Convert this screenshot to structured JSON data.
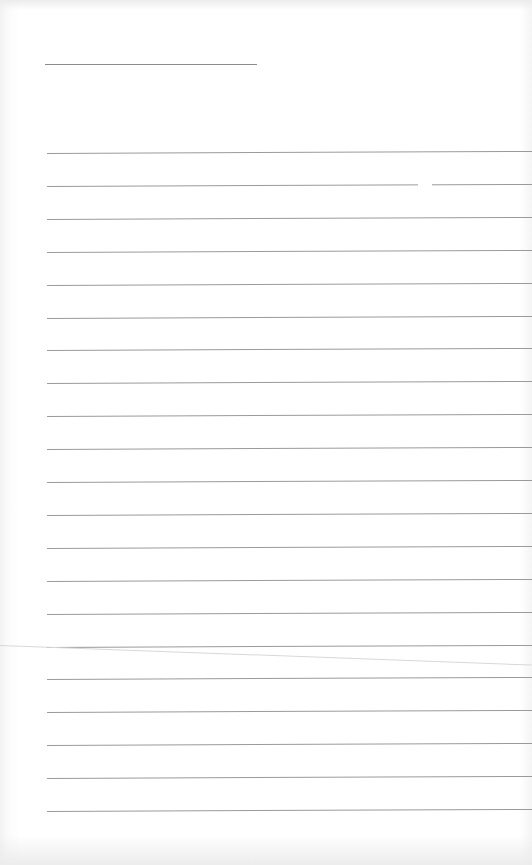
{
  "page": {
    "type": "blank ruled notebook page",
    "background_color": "#ffffff",
    "rule_color": "#9a9a9a",
    "header_line": {
      "x": 45,
      "y": 64,
      "width": 212
    },
    "ruled_lines": {
      "count": 21,
      "first_y": 153,
      "spacing": 32.9,
      "left_x": 47
    },
    "text_content": []
  }
}
